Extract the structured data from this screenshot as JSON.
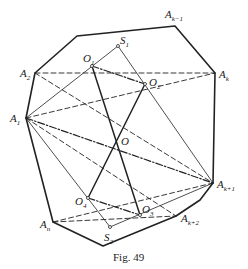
{
  "figure": {
    "caption": "Fig. 49",
    "points": {
      "A_k_minus_1": {
        "main": "A",
        "sub": "k−1"
      },
      "A_k": {
        "main": "A",
        "sub": "k"
      },
      "A_k_plus_1": {
        "main": "A",
        "sub": "k+1"
      },
      "A_k_plus_2": {
        "main": "A",
        "sub": "k+2"
      },
      "A_n": {
        "main": "A",
        "sub": "n"
      },
      "A_1": {
        "main": "A",
        "sub": "1"
      },
      "A_2": {
        "main": "A",
        "sub": "2"
      },
      "O": {
        "main": "O",
        "sub": ""
      },
      "O_1": {
        "main": "O",
        "sub": "1"
      },
      "O_2": {
        "main": "O",
        "sub": "2"
      },
      "O_3": {
        "main": "O",
        "sub": "3"
      },
      "O_4": {
        "main": "O",
        "sub": "4"
      },
      "S_1": {
        "main": "S",
        "sub": "1"
      },
      "S_2": {
        "main": "S",
        "sub": "2"
      }
    }
  }
}
